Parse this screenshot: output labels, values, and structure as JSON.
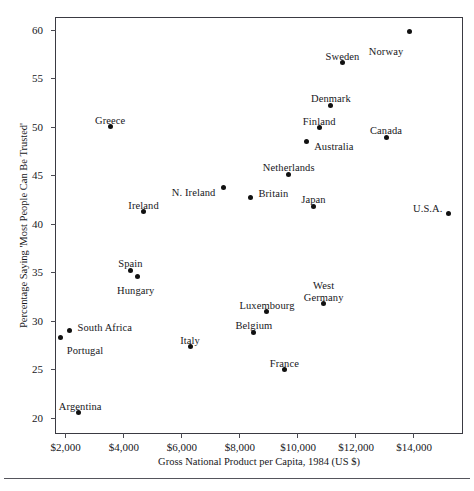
{
  "chart_data": {
    "type": "scatter",
    "title": "",
    "xlabel": "Gross National Product per Capita, 1984 (US $)",
    "ylabel": "Percentage Saying 'Most People Can Be Trusted'",
    "xlim": [
      1700,
      15750
    ],
    "ylim": [
      18.2,
      61.2
    ],
    "xticks": [
      2000,
      4000,
      6000,
      8000,
      10000,
      12000,
      14000
    ],
    "xtick_labels": [
      "$2,000",
      "$4,000",
      "$6,000",
      "$8,000",
      "$10,000",
      "$12,000",
      "$14,000"
    ],
    "yticks": [
      20,
      25,
      30,
      35,
      40,
      45,
      50,
      55,
      60
    ],
    "ytick_labels": [
      "20",
      "25",
      "30",
      "35",
      "40",
      "45",
      "50",
      "55",
      "60"
    ],
    "grid": false,
    "legend": false,
    "marker_color": "#111111",
    "frame_color": "#3a3a42",
    "points": [
      {
        "label": "Norway",
        "x": 13900,
        "y": 59.7,
        "lx": -6,
        "ly": 14,
        "align": "right",
        "multiline": false
      },
      {
        "label": "Sweden",
        "x": 11600,
        "y": 56.5,
        "lx": 0,
        "ly": -12,
        "align": "center",
        "multiline": false
      },
      {
        "label": "Denmark",
        "x": 11200,
        "y": 52.1,
        "lx": 0,
        "ly": -12,
        "align": "center",
        "multiline": false
      },
      {
        "label": "Finland",
        "x": 10800,
        "y": 49.8,
        "lx": 0,
        "ly": -12,
        "align": "center",
        "multiline": false
      },
      {
        "label": "Canada",
        "x": 13100,
        "y": 48.8,
        "lx": 0,
        "ly": -12,
        "align": "center",
        "multiline": false
      },
      {
        "label": "Australia",
        "x": 10350,
        "y": 48.4,
        "lx": 8,
        "ly": 0,
        "align": "left",
        "multiline": false
      },
      {
        "label": "Greece",
        "x": 3600,
        "y": 49.9,
        "lx": 0,
        "ly": -12,
        "align": "center",
        "multiline": false
      },
      {
        "label": "Netherlands",
        "x": 9750,
        "y": 45.0,
        "lx": 0,
        "ly": -12,
        "align": "center",
        "multiline": false
      },
      {
        "label": "N. Ireland",
        "x": 7500,
        "y": 43.6,
        "lx": -8,
        "ly": -1,
        "align": "right",
        "multiline": false
      },
      {
        "label": "Britain",
        "x": 8430,
        "y": 42.6,
        "lx": 8,
        "ly": -9,
        "align": "left",
        "multiline": false
      },
      {
        "label": "Japan",
        "x": 10600,
        "y": 41.7,
        "lx": 0,
        "ly": -12,
        "align": "center",
        "multiline": false
      },
      {
        "label": "Ireland",
        "x": 4750,
        "y": 41.1,
        "lx": 0,
        "ly": -12,
        "align": "center",
        "multiline": false
      },
      {
        "label": "U.S.A.",
        "x": 15250,
        "y": 40.9,
        "lx": -6,
        "ly": -11,
        "align": "right",
        "multiline": false
      },
      {
        "label": "Spain",
        "x": 4300,
        "y": 35.1,
        "lx": 0,
        "ly": -12,
        "align": "center",
        "multiline": false
      },
      {
        "label": "Hungary",
        "x": 4550,
        "y": 34.4,
        "lx": -2,
        "ly": 8,
        "align": "center",
        "multiline": false
      },
      {
        "label": "West Germany",
        "x": 10950,
        "y": 31.7,
        "lx": 0,
        "ly": -23,
        "align": "center",
        "multiline": true
      },
      {
        "label": "Luxembourg",
        "x": 9000,
        "y": 30.8,
        "lx": 0,
        "ly": -12,
        "align": "center",
        "multiline": false
      },
      {
        "label": "South Africa",
        "x": 2200,
        "y": 28.9,
        "lx": 8,
        "ly": -8,
        "align": "left",
        "multiline": false
      },
      {
        "label": "Belgium",
        "x": 8550,
        "y": 28.7,
        "lx": 0,
        "ly": -12,
        "align": "center",
        "multiline": false
      },
      {
        "label": "Portugal",
        "x": 1900,
        "y": 28.1,
        "lx": 6,
        "ly": 7,
        "align": "left",
        "multiline": false
      },
      {
        "label": "Italy",
        "x": 6350,
        "y": 27.2,
        "lx": 0,
        "ly": -12,
        "align": "center",
        "multiline": false
      },
      {
        "label": "France",
        "x": 9600,
        "y": 24.8,
        "lx": 0,
        "ly": -12,
        "align": "center",
        "multiline": false
      },
      {
        "label": "Argentina",
        "x": 2500,
        "y": 20.4,
        "lx": 2,
        "ly": -12,
        "align": "center",
        "multiline": false
      }
    ]
  }
}
